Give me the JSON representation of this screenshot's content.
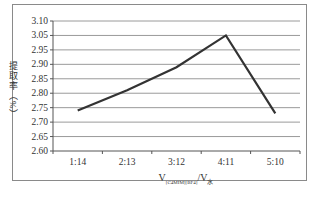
{
  "chart_data": {
    "type": "line",
    "title": "",
    "xlabel": "V[C4MIM][BF4]/V水",
    "xlabel_main": "V",
    "xlabel_sub1": "[C4MIM][BF4]",
    "xlabel_sep": "/V",
    "xlabel_sub2": "水",
    "ylabel": "提取率（%）",
    "categories": [
      "1:14",
      "2:13",
      "3:12",
      "4:11",
      "5:10"
    ],
    "series": [
      {
        "name": "提取率",
        "values": [
          2.74,
          2.81,
          2.89,
          3.05,
          2.73
        ]
      }
    ],
    "ytick_labels": [
      "3.10",
      "3.05",
      "2.95",
      "2.90",
      "2.85",
      "2.80",
      "2.75",
      "2.70",
      "2.65",
      "2.60"
    ],
    "ylim": [
      2.6,
      3.1
    ],
    "grid": true,
    "legend": "none",
    "line_color": "#333333",
    "grid_color": "#9a9a9a"
  },
  "caption": ""
}
